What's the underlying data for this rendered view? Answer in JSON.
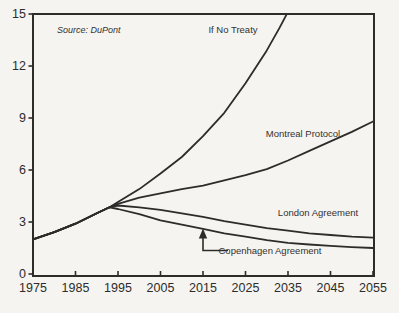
{
  "colors": {
    "ink": "#2d2c2a",
    "paper": "#f5f4f1",
    "label_text": "#33322f"
  },
  "chart_data": {
    "type": "line",
    "title": "",
    "xlabel": "",
    "ylabel": "",
    "source_note": "Source: DuPont",
    "x_range": [
      1975,
      2055
    ],
    "y_range": [
      0,
      15
    ],
    "x_ticks": [
      1975,
      1985,
      1995,
      2005,
      2015,
      2025,
      2035,
      2045,
      2055
    ],
    "y_ticks": [
      0,
      3,
      6,
      9,
      12,
      15
    ],
    "grid": false,
    "legend_position": "inline-labels",
    "series": [
      {
        "id": "no-treaty",
        "label": "If No Treaty",
        "points": [
          [
            1975,
            2.0
          ],
          [
            1980,
            2.42
          ],
          [
            1985,
            2.9
          ],
          [
            1990,
            3.5
          ],
          [
            1993,
            3.85
          ],
          [
            1995,
            4.15
          ],
          [
            2000,
            4.9
          ],
          [
            2005,
            5.8
          ],
          [
            2010,
            6.75
          ],
          [
            2015,
            7.95
          ],
          [
            2020,
            9.3
          ],
          [
            2025,
            11.0
          ],
          [
            2030,
            12.9
          ],
          [
            2033,
            14.2
          ],
          [
            2036,
            15.6
          ]
        ]
      },
      {
        "id": "montreal-protocol",
        "label": "Montreal Protocol",
        "points": [
          [
            1975,
            2.0
          ],
          [
            1980,
            2.42
          ],
          [
            1985,
            2.9
          ],
          [
            1990,
            3.5
          ],
          [
            1993,
            3.85
          ],
          [
            1995,
            4.05
          ],
          [
            2000,
            4.4
          ],
          [
            2005,
            4.65
          ],
          [
            2010,
            4.9
          ],
          [
            2015,
            5.1
          ],
          [
            2020,
            5.4
          ],
          [
            2025,
            5.7
          ],
          [
            2030,
            6.05
          ],
          [
            2035,
            6.55
          ],
          [
            2040,
            7.1
          ],
          [
            2045,
            7.65
          ],
          [
            2050,
            8.2
          ],
          [
            2055,
            8.8
          ]
        ]
      },
      {
        "id": "london-agreement",
        "label": "London Agreement",
        "points": [
          [
            1975,
            2.0
          ],
          [
            1980,
            2.42
          ],
          [
            1985,
            2.9
          ],
          [
            1990,
            3.5
          ],
          [
            1993,
            3.85
          ],
          [
            1995,
            3.95
          ],
          [
            2000,
            3.85
          ],
          [
            2005,
            3.7
          ],
          [
            2010,
            3.5
          ],
          [
            2015,
            3.3
          ],
          [
            2020,
            3.05
          ],
          [
            2025,
            2.85
          ],
          [
            2030,
            2.65
          ],
          [
            2035,
            2.5
          ],
          [
            2040,
            2.35
          ],
          [
            2045,
            2.25
          ],
          [
            2050,
            2.15
          ],
          [
            2055,
            2.1
          ]
        ]
      },
      {
        "id": "copenhagen-agreement",
        "label": "Copenhagen Agreement",
        "points": [
          [
            1975,
            2.0
          ],
          [
            1980,
            2.42
          ],
          [
            1985,
            2.9
          ],
          [
            1990,
            3.5
          ],
          [
            1993,
            3.85
          ],
          [
            1995,
            3.75
          ],
          [
            2000,
            3.45
          ],
          [
            2005,
            3.1
          ],
          [
            2010,
            2.85
          ],
          [
            2015,
            2.6
          ],
          [
            2020,
            2.35
          ],
          [
            2025,
            2.15
          ],
          [
            2030,
            1.95
          ],
          [
            2035,
            1.8
          ],
          [
            2040,
            1.7
          ],
          [
            2045,
            1.62
          ],
          [
            2050,
            1.55
          ],
          [
            2055,
            1.5
          ]
        ]
      }
    ],
    "annotation_arrow": {
      "points_to_series": "copenhagen-agreement",
      "at_year": 2015
    }
  }
}
